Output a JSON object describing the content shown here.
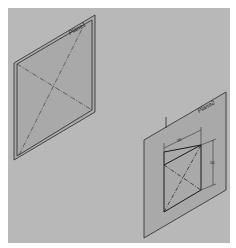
{
  "viewport": {
    "background": "#b8b8b8",
    "plane_fill": "#a9a9a9",
    "edge_color": "#2a2a2a"
  },
  "planes": [
    {
      "label": "Plane1",
      "style": "double-border",
      "diagonals": "dash-dot"
    },
    {
      "label": "Plane2",
      "style": "single-border",
      "sketch": {
        "shape": "square",
        "diagonals": "dash-dot",
        "dimensions": [
          {
            "orientation": "horizontal",
            "value": "50"
          },
          {
            "orientation": "vertical",
            "value": "50"
          }
        ]
      }
    }
  ]
}
